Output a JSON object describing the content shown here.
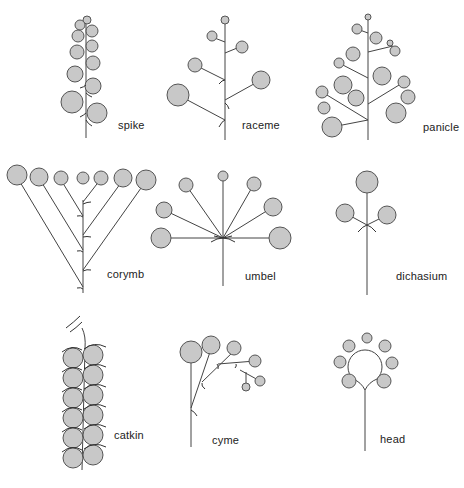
{
  "colors": {
    "flower_fill": "#c8c8c8",
    "flower_stroke": "#555555",
    "stem": "#444444",
    "background": "#ffffff"
  },
  "labels": {
    "spike": "spike",
    "raceme": "raceme",
    "panicle": "panicle",
    "corymb": "corymb",
    "umbel": "umbel",
    "dichasium": "dichasium",
    "catkin": "catkin",
    "cyme": "cyme",
    "head": "head"
  },
  "panels": [
    {
      "id": "spike",
      "row": 1,
      "col": 1
    },
    {
      "id": "raceme",
      "row": 1,
      "col": 2
    },
    {
      "id": "panicle",
      "row": 1,
      "col": 3
    },
    {
      "id": "corymb",
      "row": 2,
      "col": 1
    },
    {
      "id": "umbel",
      "row": 2,
      "col": 2
    },
    {
      "id": "dichasium",
      "row": 2,
      "col": 3
    },
    {
      "id": "catkin",
      "row": 3,
      "col": 1
    },
    {
      "id": "cyme",
      "row": 3,
      "col": 2
    },
    {
      "id": "head",
      "row": 3,
      "col": 3
    }
  ]
}
